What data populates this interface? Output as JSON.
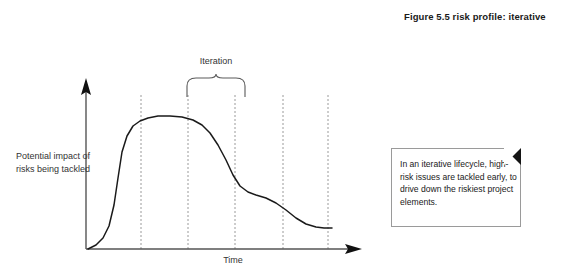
{
  "figure": {
    "caption": "Figure 5.5  risk profile: iterative",
    "background_color": "#ffffff",
    "curve_color": "#1a1a1a",
    "axis_color": "#555555",
    "gridline_color": "#999999"
  },
  "chart": {
    "y_axis_label": "Potential impact of risks being tackled",
    "x_axis_label": "Time",
    "iteration_label": "Iteration",
    "y_axis_arrow": "up-arrow",
    "x_axis_arrow": "right-arrow",
    "gridlines_x": [
      141,
      188,
      235,
      283,
      328
    ],
    "curve_points": "88,249 96,245 103,238 109,226 114,205 118,178 122,152 127,136 133,126 140,121 148,118 158,116 170,116 182,117 193,120 202,125 210,133 218,145 226,160 233,175 240,186 248,192 256,195 266,198 276,203 286,210 296,218 306,224 316,227 324,228 332,228",
    "brace": {
      "left_x": 187,
      "right_x": 245,
      "peak_x": 216,
      "top_y": 74,
      "bottom_y": 97
    }
  },
  "callout": {
    "text": "In an iterative lifecycle, high-risk issues are tackled early, to drive down the riskiest project elements.",
    "fold_corner": "top-right",
    "border_color": "#9a9a9a",
    "fold_color": "#141414"
  }
}
